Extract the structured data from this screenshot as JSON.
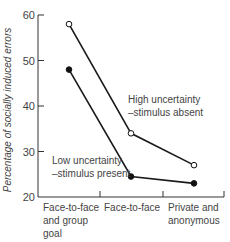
{
  "chart_data": {
    "type": "line",
    "title": "",
    "xlabel": "",
    "ylabel": "Percentage of socially induced errors",
    "ylim": [
      20,
      60
    ],
    "yticks": [
      20,
      30,
      40,
      50,
      60
    ],
    "grid": false,
    "categories": [
      "Face-to-face and group goal",
      "Face-to-face",
      "Private and anonymous"
    ],
    "category_lines": [
      [
        "Face-to-face",
        "and group",
        "goal"
      ],
      [
        "Face-to-face"
      ],
      [
        "Private and",
        "anonymous"
      ]
    ],
    "series": [
      {
        "name": "High uncertainty – stimulus absent",
        "label_lines": [
          "High uncertainty",
          "–stimulus absent"
        ],
        "marker": "open-circle",
        "values": [
          58,
          34,
          27
        ]
      },
      {
        "name": "Low uncertainty – stimulus present",
        "label_lines": [
          "Low uncertainty",
          "–stimulus present"
        ],
        "marker": "filled-circle",
        "values": [
          48,
          24.5,
          23
        ]
      }
    ]
  },
  "colors": {
    "line": "#1a1a1a",
    "axis": "#333333",
    "text": "#444444"
  }
}
